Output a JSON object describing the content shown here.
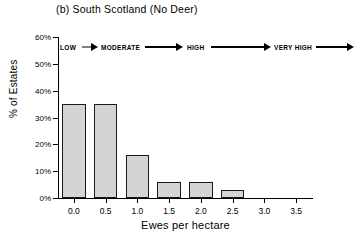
{
  "chart_data": {
    "type": "bar",
    "title": "(b) South Scotland (No Deer)",
    "xlabel": "Ewes per hectare",
    "ylabel": "% of Estates",
    "categories": [
      "0.0",
      "0.5",
      "1.0",
      "1.5",
      "2.0",
      "2.5",
      "3.0",
      "3.5"
    ],
    "values": [
      35,
      35,
      16,
      6,
      6,
      3,
      0,
      0
    ],
    "x": [
      0.0,
      0.5,
      1.0,
      1.5,
      2.0,
      2.5,
      3.0,
      3.5
    ],
    "xlim": [
      -0.25,
      3.75
    ],
    "ylim": [
      0,
      60
    ],
    "ytick_labels": [
      "0%",
      "10%",
      "20%",
      "30%",
      "40%",
      "50%",
      "60%"
    ],
    "ytick_values": [
      0,
      10,
      20,
      30,
      40,
      50,
      60
    ],
    "xtick_labels": [
      "0.0",
      "0.5",
      "1.0",
      "1.5",
      "2.0",
      "2.5",
      "3.0",
      "3.5"
    ],
    "grid": false,
    "legend": "none",
    "bar_fill_color": "#d4d4d4",
    "bar_edge_color": "#1a1a1a",
    "annotations": [
      {
        "label": "LOW",
        "x_start": 0.0,
        "x_end": 0.18
      },
      {
        "label": "MODERATE",
        "x_start": 0.22,
        "x_end": 0.62
      },
      {
        "label": "HIGH",
        "x_start": 0.66,
        "x_end": 1.22
      },
      {
        "label": "VERY HIGH",
        "x_start": 1.28,
        "x_end": 1.9
      }
    ]
  },
  "band": {
    "labels": [
      "LOW",
      "MODERATE",
      "HIGH",
      "VERY HIGH"
    ]
  }
}
